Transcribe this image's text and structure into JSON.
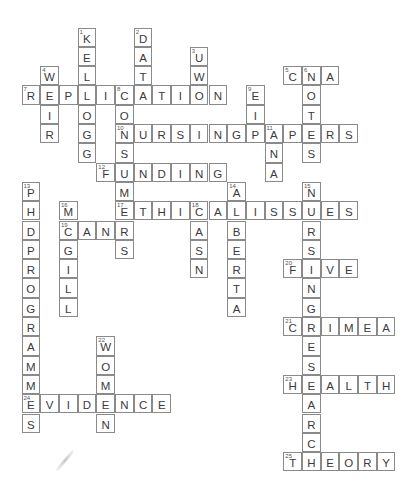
{
  "puzzle": {
    "grid": {
      "origin_x": 22,
      "origin_y": 28,
      "cell_w": 18.7,
      "cell_h": 19.3
    },
    "entries": [
      {
        "number": 1,
        "direction": "down",
        "answer": "KELLOGG",
        "col": 3,
        "row": 0
      },
      {
        "number": 2,
        "direction": "down",
        "answer": "DATA",
        "col": 6,
        "row": 0
      },
      {
        "number": 3,
        "direction": "down",
        "answer": "UWO",
        "col": 9,
        "row": 1
      },
      {
        "number": 4,
        "direction": "down",
        "answer": "WEIR",
        "col": 1,
        "row": 2
      },
      {
        "number": 5,
        "direction": "across",
        "answer": "CNA",
        "col": 14,
        "row": 2
      },
      {
        "number": 6,
        "direction": "down",
        "answer": "NOTES",
        "col": 15,
        "row": 2
      },
      {
        "number": 7,
        "direction": "across",
        "answer": "REPLICATION",
        "col": 0,
        "row": 3
      },
      {
        "number": 8,
        "direction": "down",
        "answer": "CONSUMERS",
        "col": 5,
        "row": 3
      },
      {
        "number": 9,
        "direction": "down",
        "answer": "EIP",
        "col": 12,
        "row": 3
      },
      {
        "number": 10,
        "direction": "across",
        "answer": "NURSINGPAPERS",
        "col": 5,
        "row": 5
      },
      {
        "number": 11,
        "direction": "down",
        "answer": "ANA",
        "col": 13,
        "row": 5
      },
      {
        "number": 12,
        "direction": "across",
        "answer": "FUNDING",
        "col": 4,
        "row": 7
      },
      {
        "number": 13,
        "direction": "down",
        "answer": "PHDPROGRAMMES",
        "col": 0,
        "row": 8
      },
      {
        "number": 14,
        "direction": "down",
        "answer": "ALBERTA",
        "col": 11,
        "row": 8
      },
      {
        "number": 15,
        "direction": "down",
        "answer": "NURSINGRESEARCH",
        "col": 15,
        "row": 8
      },
      {
        "number": 16,
        "direction": "down",
        "answer": "MCGILL",
        "col": 2,
        "row": 9
      },
      {
        "number": 17,
        "direction": "across",
        "answer": "ETHICALISSUES",
        "col": 5,
        "row": 9
      },
      {
        "number": 18,
        "direction": "down",
        "answer": "CASN",
        "col": 9,
        "row": 9
      },
      {
        "number": 19,
        "direction": "across",
        "answer": "CANR",
        "col": 2,
        "row": 10
      },
      {
        "number": 20,
        "direction": "across",
        "answer": "FIVE",
        "col": 14,
        "row": 12
      },
      {
        "number": 21,
        "direction": "across",
        "answer": "CRIMEA",
        "col": 14,
        "row": 15
      },
      {
        "number": 22,
        "direction": "down",
        "answer": "WOMEN",
        "col": 4,
        "row": 16
      },
      {
        "number": 23,
        "direction": "across",
        "answer": "HEALTH",
        "col": 14,
        "row": 18
      },
      {
        "number": 24,
        "direction": "across",
        "answer": "EVIDENCE",
        "col": 0,
        "row": 19
      },
      {
        "number": 25,
        "direction": "across",
        "answer": "THEORY",
        "col": 14,
        "row": 22
      }
    ]
  },
  "colors": {
    "border": "#8a8a8a",
    "letter": "#3a3a3a",
    "number": "#555555",
    "background": "#ffffff"
  }
}
